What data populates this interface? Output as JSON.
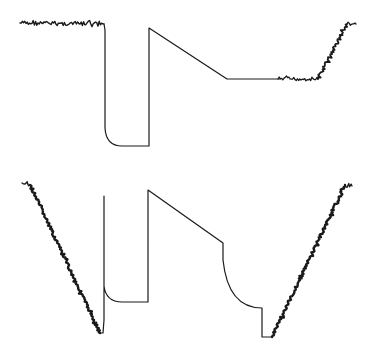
{
  "diagram": {
    "trace_color": "#1a1a1a",
    "background": "#ffffff",
    "traces": [
      {
        "name": "top-trace",
        "segments": [
          {
            "kind": "noisy",
            "points": [
              [
                20,
                23
              ],
              [
                104,
                24
              ]
            ],
            "amp": 2.2,
            "width": 1.4
          },
          {
            "kind": "path",
            "d": "M104,24 L105,30 L105,128 Q106,146 122,146 L149,146 L149,28 L227,79 L280,79",
            "width": 1.2
          },
          {
            "kind": "noisy",
            "points": [
              [
                278,
                79
              ],
              [
                318,
                79
              ]
            ],
            "amp": 2.0,
            "width": 1.3
          },
          {
            "kind": "noisy",
            "points": [
              [
                318,
                79
              ],
              [
                347,
                24
              ]
            ],
            "amp": 1.8,
            "width": 1.8
          },
          {
            "kind": "noisy",
            "points": [
              [
                347,
                24
              ],
              [
                356,
                24
              ]
            ],
            "amp": 2.0,
            "width": 1.3
          }
        ]
      },
      {
        "name": "bottom-trace",
        "segments": [
          {
            "kind": "noisy",
            "points": [
              [
                22,
                183
              ],
              [
                30,
                185
              ]
            ],
            "amp": 2.5,
            "width": 1.4
          },
          {
            "kind": "noisy",
            "points": [
              [
                30,
                185
              ],
              [
                100,
                333
              ]
            ],
            "amp": 1.2,
            "width": 2.4
          },
          {
            "kind": "path",
            "d": "M100,333 L103,333 L104,320 L104,196 L104,286 Q106,302 122,302 L148,302 L148,190 L223,243 L223,260 Q228,308 262,308 L262,337 L272,337",
            "width": 1.2
          },
          {
            "kind": "noisy",
            "points": [
              [
                272,
                337
              ],
              [
                345,
                185
              ]
            ],
            "amp": 1.3,
            "width": 2.4
          },
          {
            "kind": "noisy",
            "points": [
              [
                345,
                185
              ],
              [
                352,
                186
              ]
            ],
            "amp": 2.5,
            "width": 1.3
          }
        ]
      }
    ]
  }
}
